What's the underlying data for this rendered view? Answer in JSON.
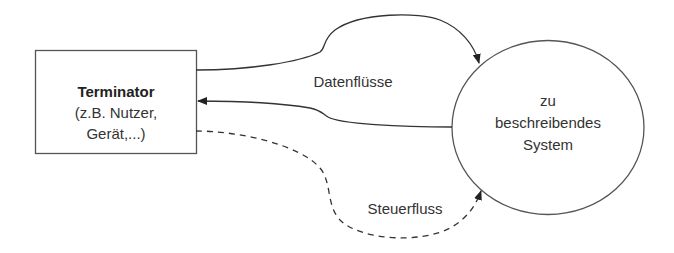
{
  "diagram": {
    "type": "context-diagram",
    "terminator": {
      "title": "Terminator",
      "line2": "(z.B. Nutzer,",
      "line3": "Gerät,...)"
    },
    "system": {
      "line1": "zu",
      "line2": "beschreibendes",
      "line3": "System"
    },
    "edges": {
      "data_flows_label": "Datenflüsse",
      "control_flow_label": "Steuerfluss"
    },
    "colors": {
      "stroke": "#3a3a3a",
      "text": "#333333",
      "background": "#ffffff"
    }
  }
}
